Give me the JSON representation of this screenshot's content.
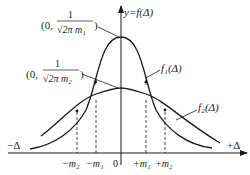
{
  "diagram": {
    "axes": {
      "y_label": "y=f(Δ)",
      "x_pos_label": "+Δ",
      "x_neg_label": "−Δ",
      "origin_label": "0"
    },
    "ticks": [
      {
        "label": "−m₂",
        "x": 77
      },
      {
        "label": "−m₁",
        "x": 96
      },
      {
        "label": "+m₁",
        "x": 146
      },
      {
        "label": "+m₂",
        "x": 165
      }
    ],
    "curves": [
      {
        "name": "f1",
        "label": "f₁(Δ)",
        "peak_label_prefix": "(0,",
        "peak_label_num": "1",
        "peak_label_den": "√2π m₁",
        "peak_label_suffix": ")"
      },
      {
        "name": "f2",
        "label": "f₂(Δ)",
        "peak_label_prefix": "(0,",
        "peak_label_num": "1",
        "peak_label_den": "√2π m₂",
        "peak_label_suffix": ")"
      }
    ],
    "colors": {
      "stroke": "#1a1a1a",
      "background": "#ffffff"
    }
  }
}
